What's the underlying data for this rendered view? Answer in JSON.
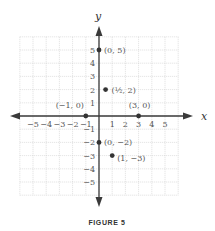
{
  "figure": {
    "caption": "FIGURE 5",
    "x_axis_label": "x",
    "y_axis_label": "y",
    "x_ticks": [
      "−5",
      "−4",
      "−3",
      "−2",
      "−1",
      "1",
      "2",
      "3",
      "4",
      "5"
    ],
    "y_ticks": [
      "5",
      "4",
      "3",
      "2",
      "1",
      "−1",
      "−2",
      "−3",
      "−4",
      "−5"
    ],
    "grid_range": {
      "xmin": -6,
      "xmax": 6,
      "ymin": -6,
      "ymax": 6
    },
    "points": [
      {
        "x": 0,
        "y": 5,
        "label": "(0, 5)"
      },
      {
        "x": 0.5,
        "y": 2,
        "label": "(½, 2)"
      },
      {
        "x": -1,
        "y": 0,
        "label": "(−1, 0)"
      },
      {
        "x": 3,
        "y": 0,
        "label": "(3, 0)"
      },
      {
        "x": 0,
        "y": -2,
        "label": "(0, −2)"
      },
      {
        "x": 1,
        "y": -3,
        "label": "(1, −3)"
      }
    ],
    "colors": {
      "axis": "#3a3a3a",
      "grid": "#c9c9c9",
      "point": "#333333"
    }
  }
}
